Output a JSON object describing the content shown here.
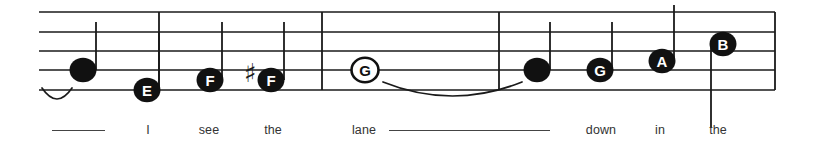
{
  "document": {
    "type": "music-notation-staff",
    "title": "Single staff line with lettered noteheads and lyrics",
    "colors": {
      "staff": "#1a1a1a",
      "note_fill": "#111111",
      "note_letter_light": "#ffffff",
      "note_letter_dark": "#111111",
      "lyric_text": "#333333",
      "background": "#ffffff"
    }
  },
  "staff": {
    "line_count": 5,
    "left": 39,
    "right": 775,
    "line_ys": [
      12,
      32,
      51,
      70,
      90
    ],
    "barlines": [
      {
        "name": "barline-1",
        "x": 159,
        "from_y": 12,
        "to_y": 90
      },
      {
        "name": "barline-2",
        "x": 322,
        "from_y": 12,
        "to_y": 90
      },
      {
        "name": "barline-3",
        "x": 499,
        "from_y": 12,
        "to_y": 90
      },
      {
        "name": "barline-end",
        "x": 775,
        "from_y": 12,
        "to_y": 90
      }
    ]
  },
  "notes": [
    {
      "id": "note-1",
      "letter": "",
      "letter_color": "none",
      "head": "filled",
      "x": 83,
      "y": 70,
      "stem": {
        "x": 96,
        "from_y": 70,
        "to_y": 22,
        "dir": "up"
      }
    },
    {
      "id": "note-2",
      "letter": "E",
      "letter_color": "white",
      "head": "filled",
      "x": 147,
      "y": 90,
      "stem": {
        "x": 159,
        "from_y": 90,
        "to_y": 32,
        "dir": "up"
      }
    },
    {
      "id": "note-3",
      "letter": "F",
      "letter_color": "white",
      "head": "filled",
      "x": 210,
      "y": 80,
      "stem": {
        "x": 222,
        "from_y": 80,
        "to_y": 22,
        "dir": "up"
      }
    },
    {
      "id": "note-4",
      "letter": "F",
      "letter_color": "white",
      "head": "filled",
      "x": 271,
      "y": 80,
      "stem": {
        "x": 284,
        "from_y": 80,
        "to_y": 22,
        "dir": "up"
      },
      "accidental": "sharp"
    },
    {
      "id": "note-5",
      "letter": "G",
      "letter_color": "black",
      "head": "open",
      "x": 365,
      "y": 70,
      "stem": null
    },
    {
      "id": "note-6",
      "letter": "",
      "letter_color": "none",
      "head": "filled",
      "x": 537,
      "y": 70,
      "stem": {
        "x": 550,
        "from_y": 70,
        "to_y": 22,
        "dir": "up"
      }
    },
    {
      "id": "note-7",
      "letter": "G",
      "letter_color": "white",
      "head": "filled",
      "x": 600,
      "y": 70,
      "stem": {
        "x": 612,
        "from_y": 70,
        "to_y": 22,
        "dir": "up"
      }
    },
    {
      "id": "note-8",
      "letter": "A",
      "letter_color": "white",
      "head": "filled",
      "x": 662,
      "y": 61,
      "stem": {
        "x": 674,
        "from_y": 61,
        "to_y": 5,
        "dir": "up"
      }
    },
    {
      "id": "note-9",
      "letter": "B",
      "letter_color": "white",
      "head": "filled",
      "x": 723,
      "y": 44,
      "stem": {
        "x": 711,
        "from_y": 44,
        "to_y": 128,
        "dir": "down"
      }
    }
  ],
  "accidentals": [
    {
      "name": "sharp-sign",
      "symbol": "♯",
      "x": 250,
      "y": 73
    }
  ],
  "slurs": [
    {
      "name": "slur-pickup",
      "x1": 42,
      "x2": 72,
      "y": 88,
      "depth": 11
    },
    {
      "name": "slur-lane",
      "x1": 383,
      "x2": 522,
      "y": 82,
      "depth": 14
    }
  ],
  "lyrics": [
    {
      "name": "lyric-extender-1",
      "type": "extender",
      "x1": 52,
      "x2": 105,
      "y": 130
    },
    {
      "name": "lyric-i",
      "type": "word",
      "text": "I",
      "x": 148,
      "y": 123
    },
    {
      "name": "lyric-see",
      "type": "word",
      "text": "see",
      "x": 209,
      "y": 123
    },
    {
      "name": "lyric-the-1",
      "type": "word",
      "text": "the",
      "x": 273,
      "y": 123
    },
    {
      "name": "lyric-lane",
      "type": "word",
      "text": "lane",
      "x": 364,
      "y": 123
    },
    {
      "name": "lyric-extender-2",
      "type": "extender",
      "x1": 389,
      "x2": 550,
      "y": 130
    },
    {
      "name": "lyric-down",
      "type": "word",
      "text": "down",
      "x": 601,
      "y": 123
    },
    {
      "name": "lyric-in",
      "type": "word",
      "text": "in",
      "x": 660,
      "y": 123
    },
    {
      "name": "lyric-the-2",
      "type": "word",
      "text": "the",
      "x": 718,
      "y": 123
    }
  ]
}
